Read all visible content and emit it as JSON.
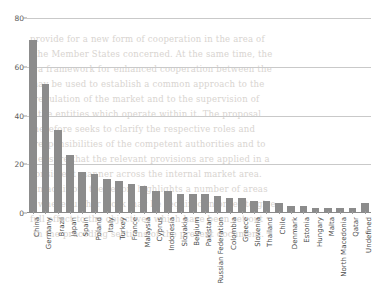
{
  "chart_data": {
    "type": "bar",
    "title": "",
    "xlabel": "",
    "ylabel": "",
    "ylim": [
      0,
      80
    ],
    "yticks": [
      0,
      20,
      40,
      60,
      80
    ],
    "grid": true,
    "legend": "none",
    "bar_color": "#8c8c8c",
    "categories": [
      "China",
      "Germany",
      "Brazil",
      "Japan",
      "Spain",
      "Poland",
      "Italy",
      "Turkey",
      "France",
      "Malaysia",
      "Cyprus",
      "Indonesia",
      "Slovakia",
      "Belgium",
      "Pakistan",
      "Russian Federation",
      "Colombia",
      "Greece",
      "Slovenia",
      "Thailand",
      "Chile",
      "Denmark",
      "Estonia",
      "Hungary",
      "Malta",
      "North Macedonia",
      "Qatar",
      "Undefined"
    ],
    "values": [
      71,
      53,
      34,
      24,
      17,
      16,
      14,
      13,
      12,
      11,
      9,
      9,
      8,
      8,
      8,
      7,
      6,
      6,
      5,
      5,
      4,
      3,
      3,
      2,
      2,
      2,
      2,
      4
    ]
  },
  "bleed_text": {
    "lines": [
      "provide for a new form of cooperation in the area of",
      "the Member States concerned. At the same time, the",
      "a framework for enhanced cooperation between the",
      "may be used to establish a common approach to the",
      "regulation of the market and to the supervision of",
      "the entities which operate within it. The proposal",
      "therefore seeks to clarify the respective roles and",
      "responsibilities of the competent authorities and to",
      "ensure that the relevant provisions are applied in a",
      "consistent manner across the internal market area.",
      "In addition, the report highlights a number of areas",
      "where further work may be required in order to give",
      "full effect to the objectives which have been set out",
      "in the preceding sections of the present document."
    ]
  }
}
